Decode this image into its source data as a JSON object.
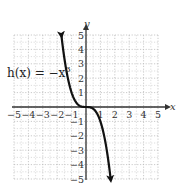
{
  "chart_data": {
    "type": "line",
    "title": "",
    "function_label": {
      "prefix": "h(x) = −x",
      "exponent": "3"
    },
    "xlabel": "x",
    "ylabel": "y",
    "xlim": [
      -5,
      5
    ],
    "ylim": [
      -5,
      5
    ],
    "grid": true,
    "x_ticks": [
      "−5",
      "−4",
      "−3",
      "−2",
      "−1",
      "1",
      "2",
      "3",
      "4",
      "5"
    ],
    "y_ticks": [
      "5",
      "4",
      "3",
      "2",
      "1",
      "−1",
      "−2",
      "−3",
      "−4",
      "−5"
    ],
    "series": [
      {
        "name": "h(x) = -x^3",
        "x": [
          -1.71,
          -1.5,
          -1.25,
          -1.0,
          -0.75,
          -0.5,
          -0.25,
          0,
          0.25,
          0.5,
          0.75,
          1.0,
          1.25,
          1.5,
          1.71
        ],
        "y": [
          5.0,
          3.375,
          1.953,
          1.0,
          0.422,
          0.125,
          0.016,
          0,
          -0.016,
          -0.125,
          -0.422,
          -1.0,
          -1.953,
          -3.375,
          -5.0
        ],
        "arrows": "both_ends"
      }
    ]
  }
}
